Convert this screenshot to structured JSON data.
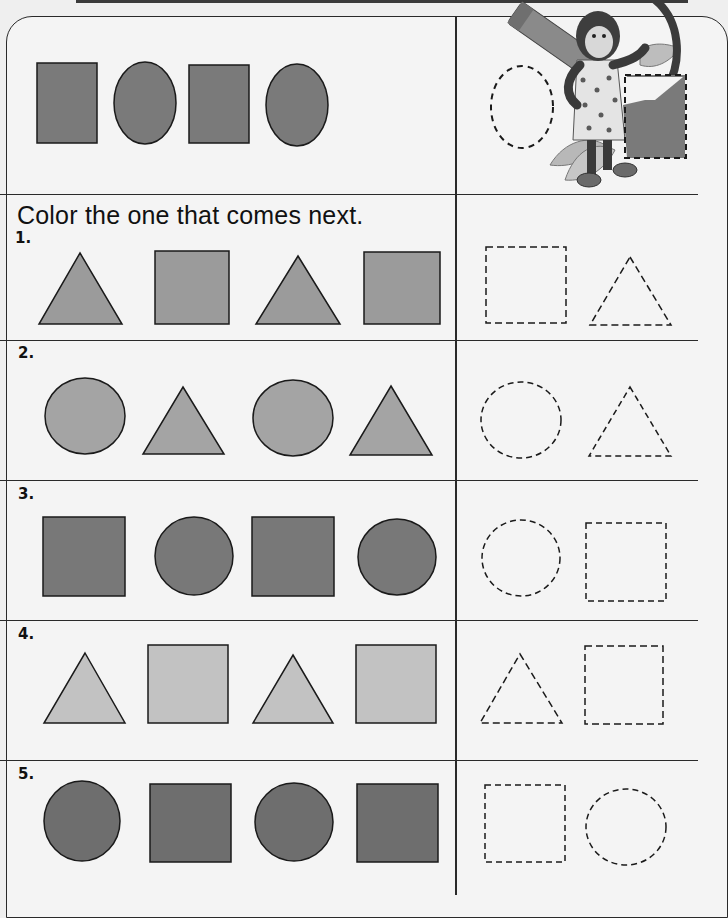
{
  "worksheet": {
    "instruction": "Color the one that comes next.",
    "example": {
      "pattern": [
        "square",
        "circle",
        "square",
        "circle"
      ],
      "choices": [
        "circle",
        "square"
      ],
      "fill": "#7a7a7a"
    },
    "problems": [
      {
        "number": "1.",
        "pattern": [
          "triangle",
          "square",
          "triangle",
          "square"
        ],
        "choices": [
          "square",
          "triangle"
        ],
        "fill": "#9b9b9b"
      },
      {
        "number": "2.",
        "pattern": [
          "circle",
          "triangle",
          "circle",
          "triangle"
        ],
        "choices": [
          "circle",
          "triangle"
        ],
        "fill": "#a4a4a4"
      },
      {
        "number": "3.",
        "pattern": [
          "square",
          "circle",
          "square",
          "circle"
        ],
        "choices": [
          "circle",
          "square"
        ],
        "fill": "#787878"
      },
      {
        "number": "4.",
        "pattern": [
          "triangle",
          "square",
          "triangle",
          "square"
        ],
        "choices": [
          "triangle",
          "square"
        ],
        "fill": "#c2c2c2"
      },
      {
        "number": "5.",
        "pattern": [
          "circle",
          "square",
          "circle",
          "square"
        ],
        "choices": [
          "square",
          "circle"
        ],
        "fill": "#6e6e6e"
      }
    ]
  },
  "illustration": "monkey-holding-crayon"
}
